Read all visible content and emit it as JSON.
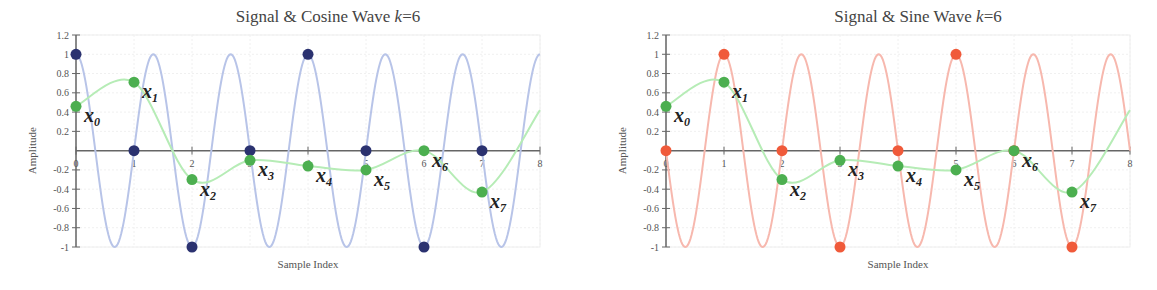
{
  "chart_data": [
    {
      "type": "line",
      "title": "Signal & Cosine Wave",
      "title_k": "k",
      "title_eq": "=6",
      "xlabel": "Sample Index",
      "ylabel": "Amplitude",
      "xlim": [
        0,
        8
      ],
      "ylim": [
        -1,
        1.2
      ],
      "xticks": [
        "0",
        "1",
        "2",
        "3",
        "4",
        "5",
        "6",
        "7",
        "8"
      ],
      "yticks": [
        "-1",
        "-0.8",
        "-0.6",
        "-0.4",
        "-0.2",
        "0.2",
        "0.4",
        "0.6",
        "0.8",
        "1",
        "1.2"
      ],
      "grid": true,
      "wave": {
        "kind": "cosine",
        "k": 6,
        "N": 8,
        "color": "#b8c4e8"
      },
      "wave_samples": {
        "name": "cosine samples",
        "color": "#2b3270",
        "x": [
          0,
          1,
          2,
          3,
          4,
          5,
          6,
          7
        ],
        "y": [
          1,
          0,
          -1,
          0,
          1,
          0,
          -1,
          0
        ]
      },
      "signal": {
        "name": "signal",
        "color": "#4caf50",
        "curve_color": "#b6ecb6",
        "x": [
          0,
          1,
          2,
          3,
          4,
          5,
          6,
          7
        ],
        "y": [
          0.46,
          0.71,
          -0.3,
          -0.1,
          -0.16,
          -0.2,
          0.0,
          -0.43
        ],
        "labels": [
          "x0",
          "x1",
          "x2",
          "x3",
          "x4",
          "x5",
          "x6",
          "x7"
        ]
      }
    },
    {
      "type": "line",
      "title": "Signal & Sine Wave",
      "title_k": "k",
      "title_eq": "=6",
      "xlabel": "Sample Index",
      "ylabel": "Amplitude",
      "xlim": [
        0,
        8
      ],
      "ylim": [
        -1,
        1.2
      ],
      "xticks": [
        "0",
        "1",
        "2",
        "3",
        "4",
        "5",
        "6",
        "7",
        "8"
      ],
      "yticks": [
        "-1",
        "-0.8",
        "-0.6",
        "-0.4",
        "-0.2",
        "0.2",
        "0.4",
        "0.6",
        "0.8",
        "1",
        "1.2"
      ],
      "grid": true,
      "wave": {
        "kind": "sine",
        "k": 6,
        "N": 8,
        "color": "#f7b8ae"
      },
      "wave_samples": {
        "name": "sine samples",
        "color": "#f05a3a",
        "x": [
          0,
          1,
          2,
          3,
          4,
          5,
          6,
          7
        ],
        "y": [
          0,
          1,
          0,
          -1,
          0,
          1,
          0,
          -1
        ]
      },
      "signal": {
        "name": "signal",
        "color": "#4caf50",
        "curve_color": "#b6ecb6",
        "x": [
          0,
          1,
          2,
          3,
          4,
          5,
          6,
          7
        ],
        "y": [
          0.46,
          0.71,
          -0.3,
          -0.1,
          -0.16,
          -0.2,
          0.0,
          -0.43
        ],
        "labels": [
          "x0",
          "x1",
          "x2",
          "x3",
          "x4",
          "x5",
          "x6",
          "x7"
        ]
      }
    }
  ]
}
